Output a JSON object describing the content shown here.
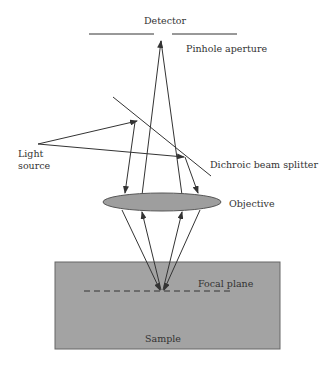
{
  "diagram": {
    "labels": {
      "detector": "Detector",
      "pinhole": "Pinhole aperture",
      "light_source_line1": "Light",
      "light_source_line2": "source",
      "beam_splitter": "Dichroic beam splitter",
      "objective": "Objective",
      "focal_plane": "Focal plane",
      "sample": "Sample"
    },
    "colors": {
      "line": "#333333",
      "objective_fill": "#9e9e9e",
      "sample_fill": "#a3a3a3"
    }
  }
}
